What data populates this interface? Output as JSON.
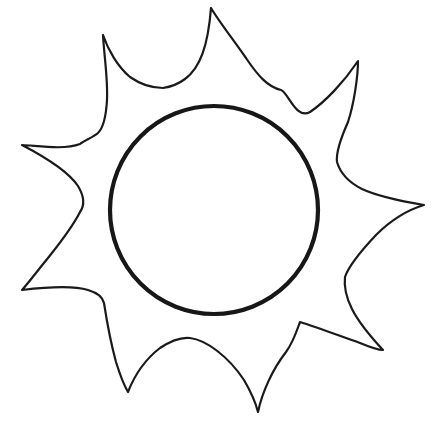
{
  "image": {
    "title": "Sun line drawing",
    "subject": "sun",
    "style": "black outline coloring-book line art",
    "background_color": "#ffffff",
    "stroke_color": "#1a1a1a",
    "width": 438,
    "height": 427,
    "alt_text": "Outline drawing of a sun: a plain circle surrounded by eight pointed flame-like rays"
  },
  "shapes": {
    "core": {
      "name": "sun-core-circle",
      "type": "circle",
      "center_x": 214,
      "center_y": 210,
      "radius": 104,
      "stroke_color": "#171717",
      "stroke_width": 4.2,
      "fill": "none"
    },
    "corona": {
      "name": "sun-rays-outline",
      "type": "path",
      "ray_count": 8,
      "stroke_color": "#1a1a1a",
      "stroke_width": 2.2,
      "fill": "none",
      "tips": [
        {
          "label": "top",
          "x": 211,
          "y": 8
        },
        {
          "label": "top-right",
          "x": 358,
          "y": 61
        },
        {
          "label": "right",
          "x": 424,
          "y": 205
        },
        {
          "label": "bottom-right",
          "x": 383,
          "y": 350
        },
        {
          "label": "bottom",
          "x": 258,
          "y": 412
        },
        {
          "label": "bottom-left",
          "x": 128,
          "y": 392
        },
        {
          "label": "left-lower",
          "x": 22,
          "y": 290
        },
        {
          "label": "left-upper",
          "x": 22,
          "y": 145
        },
        {
          "label": "top-left",
          "x": 103,
          "y": 35
        }
      ],
      "valleys": [
        {
          "label": "top-left-valley",
          "x": 163,
          "y": 88
        },
        {
          "label": "top-right-valley",
          "x": 281,
          "y": 90
        },
        {
          "label": "right-upper-valley",
          "x": 335,
          "y": 147
        },
        {
          "label": "right-lower-valley",
          "x": 331,
          "y": 272
        },
        {
          "label": "bottom-right-valley",
          "x": 300,
          "y": 322
        },
        {
          "label": "bottom-valley",
          "x": 190,
          "y": 338
        },
        {
          "label": "left-lower-valley",
          "x": 104,
          "y": 303
        },
        {
          "label": "left-mid-valley",
          "x": 80,
          "y": 212
        },
        {
          "label": "left-upper-valley",
          "x": 98,
          "y": 133
        }
      ],
      "d": "M 211 8 C 208 46 200 68 185 79 C 177 85 170 87 163 88 C 153 88 140 84 130 77 C 118 67 108 50 103 35 C 104 55 108 78 107 100 C 106 118 103 128 98 133 C 92 138 85 140 80 144 C 64 150 40 146 22 145 C 45 157 68 171 78 186 C 84 196 85 205 80 212 C 74 224 60 243 48 258 C 38 270 30 281 22 290 C 47 287 72 285 88 290 C 98 293 103 298 104 303 C 106 316 110 340 116 362 C 121 378 125 387 128 392 C 135 374 147 358 160 348 C 172 340 182 337 190 338 C 206 340 228 356 244 380 C 251 392 256 404 258 412 C 262 393 272 370 286 352 C 294 341 298 327 300 322 C 316 327 340 336 360 343 C 372 348 380 350 383 350 C 370 336 358 321 352 309 C 346 297 344 285 345 277 C 348 268 360 252 376 235 C 395 216 414 208 424 205 C 400 201 377 196 362 189 C 348 182 340 172 337 162 C 336 154 340 140 348 122 C 354 104 358 76 358 61 C 344 82 325 102 310 112 C 296 120 288 92 281 90 C 268 87 258 76 246 58 C 232 38 218 20 211 8 Z"
    }
  }
}
